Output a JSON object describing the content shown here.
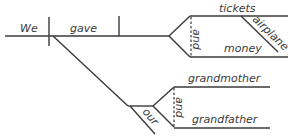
{
  "diagram": {
    "type": "sentence-diagram",
    "cutoff_text": "",
    "subject": "We",
    "verb": "gave",
    "direct_objects": {
      "conjunction": "and",
      "items": [
        {
          "word": "tickets",
          "modifier": "airplane"
        },
        {
          "word": "money"
        }
      ]
    },
    "indirect_objects": {
      "modifier": "our",
      "conjunction": "and",
      "items": [
        {
          "word": "grandmother"
        },
        {
          "word": "grandfather"
        }
      ]
    },
    "colors": {
      "line": "#3a3a3a",
      "text": "#3a3a3a",
      "background": "#ffffff"
    }
  }
}
